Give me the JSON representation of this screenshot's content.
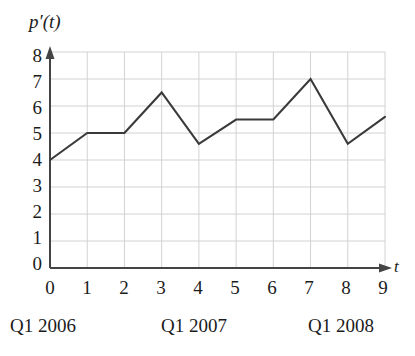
{
  "chart_data": {
    "type": "line",
    "title": "",
    "subtitle": "",
    "xlabel": "t",
    "ylabel": "p'(t)",
    "x": [
      0,
      1,
      2,
      3,
      4,
      5,
      6,
      7,
      8,
      9
    ],
    "values": [
      4,
      5,
      5,
      6.5,
      4.6,
      5.5,
      5.5,
      7,
      4.6,
      5.6
    ],
    "series": [
      {
        "name": "p'(t)",
        "values": [
          4,
          5,
          5,
          6.5,
          4.6,
          5.5,
          5.5,
          7,
          4.6,
          5.6
        ]
      }
    ],
    "xlim": [
      0,
      9
    ],
    "ylim": [
      0,
      8
    ],
    "grid": true,
    "legend": false,
    "legend_position": "none",
    "x_tick_labels": [
      "0",
      "1",
      "2",
      "3",
      "4",
      "5",
      "6",
      "7",
      "8",
      "9"
    ],
    "y_tick_labels": [
      "0",
      "1",
      "2",
      "3",
      "4",
      "5",
      "6",
      "7",
      "8"
    ],
    "annotations": [
      "Q1 2006",
      "Q1 2007",
      "Q1 2008"
    ],
    "line_color": "#3a3a3a",
    "grid_color": "#d2d2d2",
    "axis_color": "#444444"
  },
  "axes": {
    "y_title": "p′(t)",
    "x_title": "t",
    "y_ticks": [
      "0",
      "1",
      "2",
      "3",
      "4",
      "5",
      "6",
      "7",
      "8"
    ],
    "x_ticks": [
      "0",
      "1",
      "2",
      "3",
      "4",
      "5",
      "6",
      "7",
      "8",
      "9"
    ]
  },
  "captions": {
    "first": "Q1 2006",
    "second": "Q1 2007",
    "third": "Q1 2008"
  }
}
